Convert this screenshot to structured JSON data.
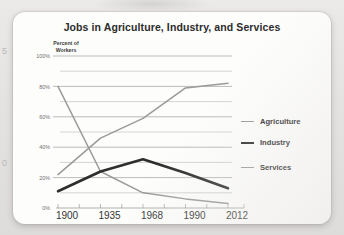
{
  "card": {
    "title": "Jobs in Agriculture, Industry, and Services",
    "y_axis_caption_line1": "Percent of",
    "y_axis_caption_line2": "Workers"
  },
  "edge_artifacts": {
    "digit_top": "5",
    "digit_bottom": "0"
  },
  "legend": {
    "items": [
      {
        "label": "Agriculture",
        "color": "#9a9a9a",
        "swatch": "agri"
      },
      {
        "label": "Industry",
        "color": "#2e2e2e",
        "swatch": "ind"
      },
      {
        "label": "Services",
        "color": "#9a9a9a",
        "swatch": "serv"
      }
    ]
  },
  "chart_data": {
    "type": "line",
    "title": "Jobs in Agriculture, Industry, and Services",
    "xlabel": "",
    "ylabel": "Percent of Workers",
    "categories": [
      "1900",
      "1935",
      "1968",
      "1990",
      "2012"
    ],
    "x_tick_labels": [
      "1900",
      "1935",
      "1968",
      "1990",
      "2012"
    ],
    "y_tick_labels": [
      "0%",
      "20%",
      "40%",
      "60%",
      "80%",
      "100%"
    ],
    "y_ticks": [
      0,
      20,
      40,
      60,
      80,
      100
    ],
    "ylim": [
      0,
      100
    ],
    "grid": true,
    "grid_interval": 10,
    "legend_position": "right",
    "series": [
      {
        "name": "Agriculture",
        "color": "#9a9a9a",
        "width": 1.5,
        "values": [
          80,
          24,
          10,
          6,
          3
        ]
      },
      {
        "name": "Industry",
        "color": "#2e2e2e",
        "width": 2.6,
        "values": [
          11,
          24,
          32,
          23,
          13
        ]
      },
      {
        "name": "Services",
        "color": "#9a9a9a",
        "width": 1.5,
        "values": [
          22,
          46,
          59,
          79,
          82
        ]
      }
    ]
  }
}
